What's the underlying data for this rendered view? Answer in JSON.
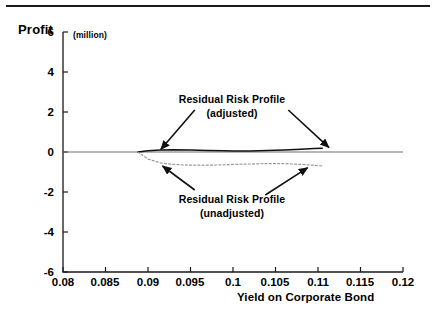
{
  "figure": {
    "y_axis_title": "Profit",
    "y_axis_units": "(million)",
    "x_axis_title": "Yield on Corporate Bond",
    "annotation_adjusted_line1": "Residual Risk Profile",
    "annotation_adjusted_line2": "(adjusted)",
    "annotation_unadjusted_line1": "Residual Risk Profile",
    "annotation_unadjusted_line2": "(unadjusted)"
  },
  "chart_data": {
    "type": "line",
    "title": "",
    "subtitle": "",
    "xlabel": "Yield on Corporate Bond",
    "ylabel": "Profit",
    "ylabel_units": "(million)",
    "xlim": [
      0.08,
      0.12
    ],
    "ylim": [
      -6,
      6
    ],
    "grid": false,
    "legend": "none",
    "annotations": [
      {
        "text": "Residual Risk Profile (adjusted)",
        "lines": [
          "Residual Risk Profile",
          "(adjusted)"
        ],
        "target_series": "Residual Risk Profile (adjusted)",
        "arrows": [
          {
            "from_x": 0.0955,
            "from_y": 2.1,
            "to_x": 0.0915,
            "to_y": 0.12
          },
          {
            "from_x": 0.1065,
            "from_y": 2.1,
            "to_x": 0.1113,
            "to_y": 0.22
          }
        ]
      },
      {
        "text": "Residual Risk Profile (unadjusted)",
        "lines": [
          "Residual Risk Profile",
          "(unadjusted)"
        ],
        "target_series": "Residual Risk Profile (unadjusted)",
        "arrows": [
          {
            "from_x": 0.0955,
            "from_y": -1.9,
            "to_x": 0.0917,
            "to_y": -0.7
          },
          {
            "from_x": 0.1038,
            "from_y": -2.15,
            "to_x": 0.1088,
            "to_y": -0.78
          }
        ]
      }
    ],
    "x_ticks": [
      0.08,
      0.085,
      0.09,
      0.095,
      0.1,
      0.105,
      0.11,
      0.115,
      0.12
    ],
    "x_tick_labels": [
      "0.08",
      "0.085",
      "0.09",
      "0.095",
      "0.1",
      "0.105",
      "0.11",
      "0.115",
      "0.12"
    ],
    "y_ticks": [
      6,
      4,
      2,
      0,
      -2,
      -4,
      -6
    ],
    "y_tick_labels": [
      "6",
      "4",
      "2",
      "0",
      "-2",
      "-4",
      "-6"
    ],
    "zero_line": {
      "y": 0,
      "style": "solid",
      "color": "#6e6e6e",
      "spans_full_axis": true
    },
    "series": [
      {
        "name": "Residual Risk Profile (adjusted)",
        "style": "solid",
        "color": "#111111",
        "x": [
          0.0888,
          0.09,
          0.0915,
          0.093,
          0.095,
          0.097,
          0.099,
          0.1,
          0.102,
          0.104,
          0.106,
          0.108,
          0.1095,
          0.1105
        ],
        "y": [
          0.0,
          0.06,
          0.1,
          0.11,
          0.1,
          0.08,
          0.06,
          0.05,
          0.05,
          0.07,
          0.1,
          0.14,
          0.17,
          0.19
        ]
      },
      {
        "name": "Residual Risk Profile (unadjusted)",
        "style": "dotted",
        "color": "#9a9a9a",
        "x": [
          0.0888,
          0.09,
          0.0915,
          0.093,
          0.095,
          0.097,
          0.099,
          0.1,
          0.102,
          0.104,
          0.106,
          0.108,
          0.1095,
          0.1105
        ],
        "y": [
          0.0,
          -0.35,
          -0.55,
          -0.62,
          -0.66,
          -0.66,
          -0.64,
          -0.62,
          -0.6,
          -0.58,
          -0.58,
          -0.62,
          -0.66,
          -0.7
        ]
      }
    ]
  }
}
